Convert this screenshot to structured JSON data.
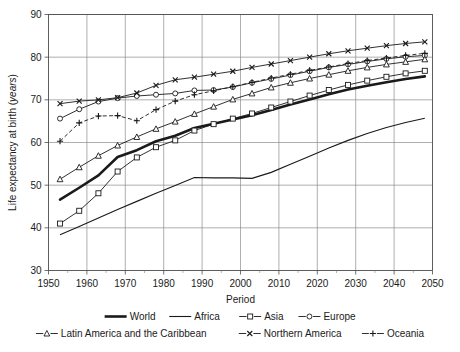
{
  "chart_data": {
    "type": "line",
    "title": "",
    "xlabel": "Period",
    "ylabel": "Life expectancy at birth (years)",
    "ylabel_plain": "Life expectancy at birth (",
    "ylabel_italic": "years",
    "ylabel_tail": ")",
    "xlim": [
      1950,
      2050
    ],
    "ylim": [
      30,
      90
    ],
    "grid": true,
    "legend_position": "bottom",
    "x_ticks": [
      1950,
      1960,
      1970,
      1980,
      1990,
      2000,
      2010,
      2020,
      2030,
      2040,
      2050
    ],
    "x_minor_ticks": [
      1955,
      1965,
      1975,
      1985,
      1995,
      2005,
      2015,
      2025,
      2035,
      2045
    ],
    "y_ticks": [
      30,
      40,
      50,
      60,
      70,
      80,
      90
    ],
    "x": [
      1953,
      1958,
      1963,
      1968,
      1973,
      1978,
      1983,
      1988,
      1993,
      1998,
      2003,
      2008,
      2013,
      2018,
      2023,
      2028,
      2033,
      2038,
      2043,
      2048
    ],
    "series": [
      {
        "name": "World",
        "marker": "none",
        "line": "solid-thick",
        "stroke_width": 2.6,
        "values": [
          46.6,
          49.4,
          52.3,
          56.6,
          58.2,
          60.3,
          61.6,
          63.4,
          64.4,
          65.4,
          66.4,
          67.6,
          68.9,
          70.1,
          71.3,
          72.4,
          73.3,
          74.1,
          74.9,
          75.5
        ]
      },
      {
        "name": "Africa",
        "marker": "none",
        "line": "solid-thin",
        "stroke_width": 1.1,
        "values": [
          38.4,
          40.3,
          42.3,
          44.3,
          46.2,
          48.1,
          49.9,
          51.8,
          51.7,
          51.7,
          51.6,
          53.0,
          54.9,
          56.8,
          58.7,
          60.5,
          62.1,
          63.5,
          64.7,
          65.7
        ]
      },
      {
        "name": "Asia",
        "marker": "square",
        "line": "solid-thin",
        "stroke_width": 0.9,
        "values": [
          41.0,
          44.0,
          48.1,
          53.2,
          56.5,
          58.9,
          60.5,
          62.8,
          64.3,
          65.6,
          66.8,
          68.2,
          69.6,
          71.0,
          72.3,
          73.5,
          74.5,
          75.4,
          76.2,
          76.8
        ]
      },
      {
        "name": "Europe",
        "marker": "circle",
        "line": "solid-thin",
        "stroke_width": 0.9,
        "values": [
          65.6,
          67.8,
          69.6,
          70.4,
          70.9,
          71.2,
          71.5,
          72.2,
          72.3,
          73.0,
          74.0,
          74.9,
          75.8,
          76.7,
          77.6,
          78.3,
          79.0,
          79.6,
          80.1,
          80.4
        ]
      },
      {
        "name": "Latin America and the Caribbean",
        "marker": "triangle",
        "line": "solid-thin",
        "stroke_width": 0.9,
        "values": [
          51.4,
          54.2,
          56.9,
          59.3,
          61.3,
          63.2,
          64.9,
          66.7,
          68.4,
          70.1,
          71.5,
          72.9,
          74.0,
          75.0,
          75.9,
          76.8,
          77.6,
          78.3,
          78.9,
          79.5
        ]
      },
      {
        "name": "Northern America",
        "marker": "cross",
        "line": "solid-thin",
        "stroke_width": 0.9,
        "values": [
          69.1,
          69.7,
          70.0,
          70.5,
          71.6,
          73.4,
          74.7,
          75.3,
          76.0,
          76.7,
          77.6,
          78.4,
          79.2,
          80.0,
          80.8,
          81.5,
          82.1,
          82.7,
          83.2,
          83.6
        ]
      },
      {
        "name": "Oceania",
        "marker": "plus",
        "line": "dashed",
        "stroke_width": 0.9,
        "values": [
          60.3,
          64.6,
          66.2,
          66.3,
          65.1,
          67.7,
          69.7,
          71.2,
          72.1,
          73.1,
          74.1,
          75.1,
          76.0,
          76.9,
          77.7,
          78.5,
          79.2,
          79.8,
          80.4,
          80.9
        ]
      }
    ],
    "legend_rows": [
      [
        "World",
        "Africa",
        "Asia",
        "Europe"
      ],
      [
        "Latin America and the Caribbean",
        "Northern America",
        "Oceania"
      ]
    ]
  }
}
